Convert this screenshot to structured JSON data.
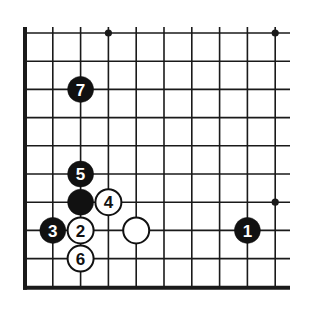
{
  "diagram": {
    "type": "go-board-corner",
    "region": "lower-left corner",
    "grid": {
      "origin_x": 25,
      "origin_y": 33,
      "spacing_x": 27.8,
      "spacing_y": 28.2,
      "columns": 10,
      "rows": 10,
      "right_extent": 290,
      "edges": [
        "left",
        "bottom"
      ],
      "line_color": "#1a1a1a",
      "edge_width": 4,
      "line_width": 1.6
    },
    "star_points": [
      {
        "col": 3,
        "row": 0
      },
      {
        "col": 9,
        "row": 0
      },
      {
        "col": 9,
        "row": 6
      }
    ],
    "stones": [
      {
        "color": "black",
        "col": 8,
        "row": 7,
        "label": "1"
      },
      {
        "color": "white",
        "col": 2,
        "row": 7,
        "label": "2"
      },
      {
        "color": "black",
        "col": 1,
        "row": 7,
        "label": "3"
      },
      {
        "color": "white",
        "col": 3,
        "row": 6,
        "label": "4"
      },
      {
        "color": "black",
        "col": 2,
        "row": 5,
        "label": "5"
      },
      {
        "color": "white",
        "col": 2,
        "row": 8,
        "label": "6"
      },
      {
        "color": "black",
        "col": 2,
        "row": 2,
        "label": "7"
      },
      {
        "color": "black",
        "col": 2,
        "row": 6,
        "label": ""
      },
      {
        "color": "white",
        "col": 4,
        "row": 7,
        "label": ""
      }
    ],
    "colors": {
      "black_stone": "#111111",
      "white_stone": "#ffffff",
      "black_label": "#ffffff",
      "white_label": "#111111",
      "background": "#ffffff"
    }
  }
}
